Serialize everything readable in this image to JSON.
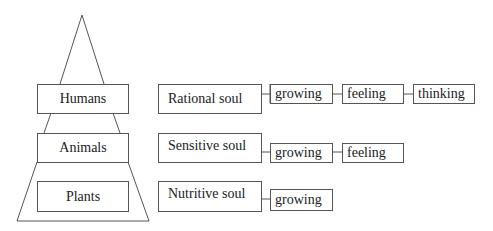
{
  "diagram": {
    "pyramid": {
      "levels": [
        {
          "label": "Humans"
        },
        {
          "label": "Animals"
        },
        {
          "label": "Plants"
        }
      ]
    },
    "souls": [
      {
        "label": "Rational soul",
        "faculties": [
          "growing",
          "feeling",
          "thinking"
        ]
      },
      {
        "label": "Sensitive soul",
        "faculties": [
          "growing",
          "feeling"
        ]
      },
      {
        "label": "Nutritive soul",
        "faculties": [
          "growing"
        ]
      }
    ]
  }
}
